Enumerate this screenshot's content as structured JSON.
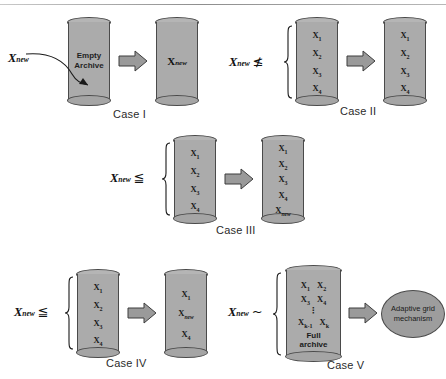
{
  "figure": {
    "type": "diagram",
    "colors": {
      "cylinder_fill": "#ababab",
      "cylinder_stroke": "#4a4a4a",
      "arrow_fill": "#9a9a9a",
      "ellipse_fill": "#9d9d9d",
      "background": "#ffffff",
      "text": "#1a1a1a"
    },
    "symbols": {
      "x_new": "X",
      "x_new_sub": "new",
      "leq": "≦",
      "nleq": "≰",
      "tilde": "~",
      "vdots": "⋮"
    }
  },
  "cases": [
    {
      "id": "case-1",
      "caption": "Case I",
      "input_label": {
        "base": "X",
        "sub": "new",
        "relation": ""
      },
      "source": {
        "kind": "empty-archive",
        "lines": [
          "Empty",
          "Archive"
        ],
        "items": []
      },
      "result": {
        "kind": "archive",
        "items": [
          "X_new"
        ]
      },
      "has_curved_arrow": true,
      "has_brace": false
    },
    {
      "id": "case-2",
      "caption": "Case II",
      "input_label": {
        "base": "X",
        "sub": "new",
        "relation": "≰"
      },
      "source": {
        "kind": "archive",
        "items": [
          "X_1",
          "X_2",
          "X_3",
          "X_4"
        ]
      },
      "result": {
        "kind": "archive",
        "items": [
          "X_1",
          "X_2",
          "X_3",
          "X_4"
        ]
      },
      "has_curved_arrow": false,
      "has_brace": true
    },
    {
      "id": "case-3",
      "caption": "Case III",
      "input_label": {
        "base": "X",
        "sub": "new",
        "relation": "≦"
      },
      "source": {
        "kind": "archive",
        "items": [
          "X_1",
          "X_2",
          "X_3",
          "X_4"
        ]
      },
      "result": {
        "kind": "archive",
        "items": [
          "X_1",
          "X_2",
          "X_3",
          "X_4",
          "X_new"
        ]
      },
      "has_curved_arrow": false,
      "has_brace": true
    },
    {
      "id": "case-4",
      "caption": "Case IV",
      "input_label": {
        "base": "X",
        "sub": "new",
        "relation": "≦"
      },
      "source": {
        "kind": "archive",
        "items": [
          "X_1",
          "X_2",
          "X_3",
          "X_4"
        ]
      },
      "result": {
        "kind": "archive",
        "items": [
          "X_1",
          "X_new",
          "X_4"
        ]
      },
      "has_curved_arrow": false,
      "has_brace": true
    },
    {
      "id": "case-5",
      "caption": "Case V",
      "input_label": {
        "base": "X",
        "sub": "new",
        "relation": "~"
      },
      "source": {
        "kind": "full-archive",
        "grid": [
          [
            "X_1",
            "X_2"
          ],
          [
            "X_3",
            "X_4"
          ],
          [
            "X_k-1",
            "X_k"
          ]
        ],
        "dots": "⋮",
        "footer_lines": [
          "Full",
          "archive"
        ]
      },
      "result": {
        "kind": "process",
        "lines": [
          "Adaptive grid",
          "mechanism"
        ]
      },
      "has_curved_arrow": false,
      "has_brace": true
    }
  ],
  "item_text": {
    "X_1": {
      "base": "X",
      "sub": "1"
    },
    "X_2": {
      "base": "X",
      "sub": "2"
    },
    "X_3": {
      "base": "X",
      "sub": "3"
    },
    "X_4": {
      "base": "X",
      "sub": "4"
    },
    "X_k": {
      "base": "X",
      "sub": "k"
    },
    "X_k-1": {
      "base": "X",
      "sub": "k-1"
    },
    "X_new": {
      "base": "X",
      "sub": "new"
    }
  },
  "captions": {
    "case1": "Case I",
    "case2": "Case II",
    "case3": "Case III",
    "case4": "Case IV",
    "case5": "Case V"
  },
  "labels": {
    "empty_line1": "Empty",
    "empty_line2": "Archive",
    "full_line1": "Full",
    "full_line2": "archive",
    "adaptive_line1": "Adaptive grid",
    "adaptive_line2": "mechanism",
    "x": "X",
    "new": "new",
    "leq": "≦",
    "nleq": "≰",
    "tilde": "~",
    "vdots": "⋮",
    "sub1": "1",
    "sub2": "2",
    "sub3": "3",
    "sub4": "4",
    "subk": "k",
    "subkm1": "k-1"
  }
}
